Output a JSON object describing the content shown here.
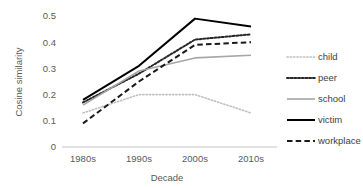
{
  "chart_data": {
    "type": "line",
    "title": "",
    "xlabel": "Decade",
    "ylabel": "Cosine similarity",
    "categories": [
      "1980s",
      "1990s",
      "2000s",
      "2010s"
    ],
    "ylim": [
      0,
      0.5
    ],
    "yticks": [
      "0",
      "0.1",
      "0.2",
      "0.3",
      "0.4",
      "0.5"
    ],
    "ytick_values": [
      0,
      0.1,
      0.2,
      0.3,
      0.4,
      0.5
    ],
    "grid": false,
    "legend_position": "right",
    "series": [
      {
        "name": "child",
        "values": [
          0.13,
          0.2,
          0.2,
          0.13
        ],
        "color": "#BFBFBF",
        "style": "dotted",
        "width": 1.6
      },
      {
        "name": "peer",
        "values": [
          0.17,
          0.28,
          0.41,
          0.43
        ],
        "color": "#262626",
        "style": "dotted",
        "width": 2.0
      },
      {
        "name": "school",
        "values": [
          0.16,
          0.29,
          0.34,
          0.35
        ],
        "color": "#A6A6A6",
        "style": "solid",
        "width": 1.6
      },
      {
        "name": "victim",
        "values": [
          0.18,
          0.31,
          0.49,
          0.46
        ],
        "color": "#000000",
        "style": "solid",
        "width": 2.0
      },
      {
        "name": "workplace",
        "values": [
          0.09,
          0.25,
          0.39,
          0.4
        ],
        "color": "#1A1A1A",
        "style": "dashed",
        "width": 2.0
      }
    ]
  },
  "legend": {
    "items": [
      {
        "label": "child"
      },
      {
        "label": "peer"
      },
      {
        "label": "school"
      },
      {
        "label": "victim"
      },
      {
        "label": "workplace"
      }
    ]
  },
  "colors": {
    "axis": "#D9D9D9",
    "tick_label": "#595959",
    "legend_label": "#404040",
    "background": "#FFFFFF"
  }
}
